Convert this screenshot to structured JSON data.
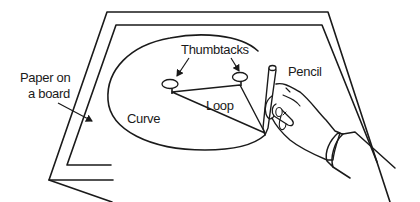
{
  "diagram": {
    "labels": {
      "paper": [
        "Paper on",
        "a board"
      ],
      "curve": "Curve",
      "thumbtacks": "Thumbtacks",
      "loop": "Loop",
      "pencil": "Pencil"
    },
    "colors": {
      "line": "#1a1a1a",
      "background": "#ffffff"
    }
  }
}
